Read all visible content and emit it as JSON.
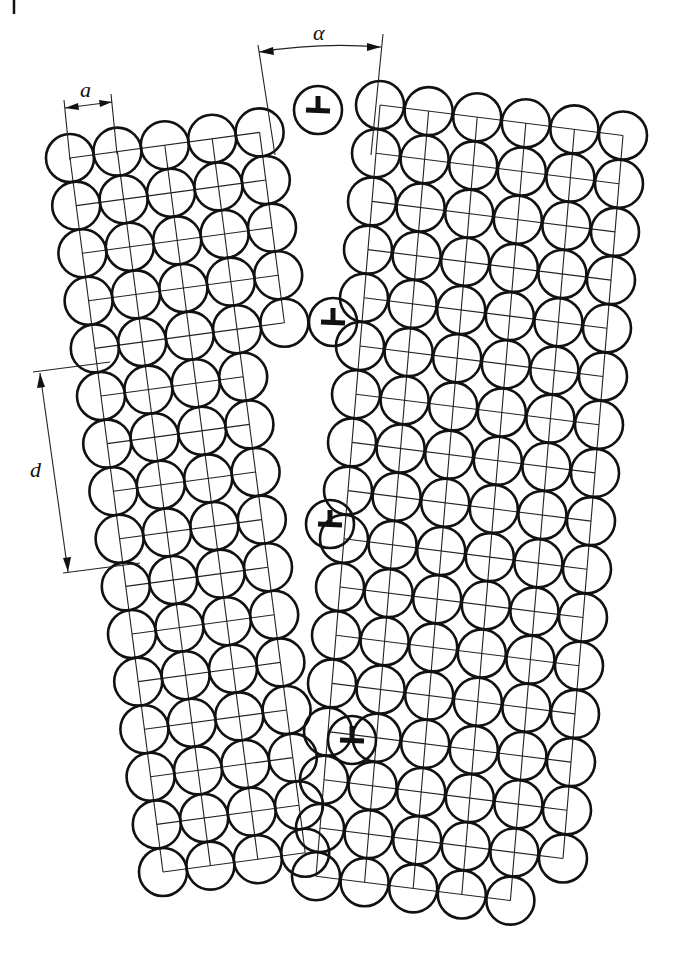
{
  "figure": {
    "corner_mark": "|",
    "labels": {
      "lattice_spacing": "a",
      "misorientation_angle": "α",
      "dislocation_spacing": "d"
    },
    "dislocation_symbol": "⊥",
    "dislocation_count": 4,
    "colors": {
      "ink": "#111111",
      "background": "#ffffff"
    }
  },
  "geometry": {
    "atom_radius": 24,
    "left_grain": {
      "origin": [
        70,
        158
      ],
      "row_step": [
        6.2,
        47.6
      ],
      "col_step": [
        47.4,
        -6.4
      ],
      "rows": [
        {
          "start": 0,
          "count": 5
        },
        {
          "start": 0,
          "count": 5
        },
        {
          "start": 0,
          "count": 5
        },
        {
          "start": 0,
          "count": 5
        },
        {
          "start": 0,
          "count": 5
        },
        {
          "start": 0,
          "count": 4
        },
        {
          "start": 0,
          "count": 4
        },
        {
          "start": 0,
          "count": 4
        },
        {
          "start": 0,
          "count": 4
        },
        {
          "start": 0,
          "count": 4
        },
        {
          "start": 0,
          "count": 4
        },
        {
          "start": 0,
          "count": 4
        },
        {
          "start": 0,
          "count": 4
        },
        {
          "start": 0,
          "count": 4
        },
        {
          "start": 0,
          "count": 4
        },
        {
          "start": 0,
          "count": 4
        }
      ]
    },
    "right_grain": {
      "origin": [
        380,
        105
      ],
      "row_step": [
        -4.0,
        48.2
      ],
      "col_step": [
        48.6,
        6.1
      ],
      "rows": [
        {
          "start": 0,
          "count": 6
        },
        {
          "start": 0,
          "count": 6
        },
        {
          "start": 0,
          "count": 6
        },
        {
          "start": 0,
          "count": 6
        },
        {
          "start": 0,
          "count": 6
        },
        {
          "start": 0,
          "count": 6
        },
        {
          "start": 0,
          "count": 6
        },
        {
          "start": 0,
          "count": 6
        },
        {
          "start": 0,
          "count": 6
        },
        {
          "start": 0,
          "count": 6
        },
        {
          "start": 0,
          "count": 6
        },
        {
          "start": 0,
          "count": 6
        },
        {
          "start": 0,
          "count": 6
        },
        {
          "start": 0,
          "count": 6
        },
        {
          "start": 0,
          "count": 6
        },
        {
          "start": 0,
          "count": 6
        },
        {
          "start": 0,
          "count": 5
        }
      ]
    },
    "dislocations": [
      {
        "x": 318,
        "y": 110
      },
      {
        "x": 333,
        "y": 322
      },
      {
        "x": 330,
        "y": 524
      },
      {
        "x": 352,
        "y": 740
      }
    ],
    "dimension_a": {
      "x1": 64,
      "y1": 107,
      "x2": 113,
      "y2": 101,
      "label_x": 80,
      "label_y": 96
    },
    "dimension_alpha": {
      "x1": 260,
      "y1": 50,
      "x2": 383,
      "y2": 46,
      "label_x": 315,
      "label_y": 40
    },
    "dimension_d": {
      "x1": 40,
      "y1": 342,
      "x2": 70,
      "y2": 572,
      "label_x": 30,
      "label_y": 470
    }
  }
}
